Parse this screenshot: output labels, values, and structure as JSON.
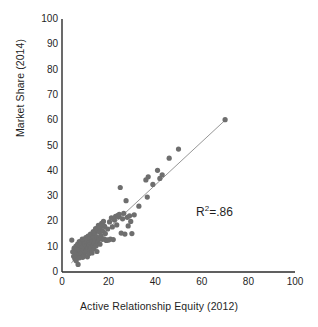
{
  "chart_data": {
    "type": "scatter",
    "title": "",
    "xlabel": "Active Relationship Equity (2012)",
    "ylabel": "Market Share (2014)",
    "xlim": [
      0,
      100
    ],
    "ylim": [
      0,
      100
    ],
    "xticks": [
      0,
      20,
      40,
      60,
      80,
      100
    ],
    "yticks": [
      0,
      10,
      20,
      30,
      40,
      50,
      60,
      70,
      80,
      90,
      100
    ],
    "grid": false,
    "legend": null,
    "annotations": [
      {
        "name": "r-squared",
        "text_prefix": "R",
        "text_sup": "2",
        "text_suffix": "=.86",
        "value": 0.86,
        "x": 56,
        "y": 24
      }
    ],
    "marker": {
      "shape": "circle",
      "size_px": 2.6,
      "color": "#6e6e6e"
    },
    "trendline": {
      "type": "linear",
      "color": "#8a8a8a",
      "width_px": 0.9,
      "x_start": 4.0,
      "y_start": 3.6,
      "x_end": 70.0,
      "y_end": 60.0
    },
    "axis_color": "#2b2b2b",
    "points": [
      [
        4.2,
        12.6
      ],
      [
        4.6,
        8.0
      ],
      [
        5.0,
        6.2
      ],
      [
        5.2,
        9.4
      ],
      [
        5.5,
        5.2
      ],
      [
        5.8,
        7.6
      ],
      [
        6.0,
        10.2
      ],
      [
        6.1,
        4.4
      ],
      [
        6.3,
        8.8
      ],
      [
        6.5,
        6.6
      ],
      [
        6.7,
        11.0
      ],
      [
        6.9,
        3.0
      ],
      [
        7.0,
        9.0
      ],
      [
        7.2,
        7.0
      ],
      [
        7.4,
        12.0
      ],
      [
        7.5,
        5.6
      ],
      [
        7.7,
        10.6
      ],
      [
        7.9,
        8.2
      ],
      [
        8.0,
        6.8
      ],
      [
        8.2,
        11.6
      ],
      [
        8.4,
        9.6
      ],
      [
        8.5,
        7.4
      ],
      [
        8.7,
        13.0
      ],
      [
        8.9,
        5.8
      ],
      [
        9.0,
        10.0
      ],
      [
        9.2,
        8.6
      ],
      [
        9.4,
        12.2
      ],
      [
        9.5,
        6.4
      ],
      [
        9.7,
        9.8
      ],
      [
        9.9,
        11.4
      ],
      [
        10.0,
        7.8
      ],
      [
        10.2,
        13.6
      ],
      [
        10.4,
        10.4
      ],
      [
        10.5,
        8.4
      ],
      [
        10.7,
        12.8
      ],
      [
        10.9,
        6.0
      ],
      [
        11.0,
        9.2
      ],
      [
        11.2,
        14.2
      ],
      [
        11.4,
        11.2
      ],
      [
        11.5,
        7.2
      ],
      [
        11.7,
        10.8
      ],
      [
        11.9,
        13.2
      ],
      [
        12.0,
        8.9
      ],
      [
        12.2,
        15.0
      ],
      [
        12.4,
        11.8
      ],
      [
        12.5,
        9.5
      ],
      [
        12.7,
        14.6
      ],
      [
        12.9,
        7.5
      ],
      [
        13.0,
        12.4
      ],
      [
        13.2,
        10.1
      ],
      [
        13.4,
        16.0
      ],
      [
        13.5,
        13.8
      ],
      [
        13.7,
        9.1
      ],
      [
        13.9,
        11.5
      ],
      [
        14.0,
        15.4
      ],
      [
        14.2,
        12.7
      ],
      [
        14.4,
        17.2
      ],
      [
        14.6,
        10.3
      ],
      [
        14.8,
        14.0
      ],
      [
        15.0,
        8.1
      ],
      [
        15.2,
        16.6
      ],
      [
        15.4,
        12.1
      ],
      [
        15.6,
        18.4
      ],
      [
        15.8,
        13.4
      ],
      [
        16.0,
        15.8
      ],
      [
        16.3,
        11.0
      ],
      [
        16.5,
        17.6
      ],
      [
        16.8,
        14.4
      ],
      [
        17.0,
        19.2
      ],
      [
        17.3,
        12.9
      ],
      [
        17.5,
        16.2
      ],
      [
        17.8,
        20.0
      ],
      [
        18.0,
        13.1
      ],
      [
        18.3,
        18.0
      ],
      [
        18.6,
        15.2
      ],
      [
        19.0,
        12.5
      ],
      [
        19.3,
        12.7
      ],
      [
        19.6,
        17.0
      ],
      [
        20.0,
        12.6
      ],
      [
        20.4,
        19.8
      ],
      [
        20.8,
        13.0
      ],
      [
        21.2,
        21.4
      ],
      [
        21.6,
        17.8
      ],
      [
        22.0,
        12.8
      ],
      [
        22.5,
        20.6
      ],
      [
        23.0,
        22.0
      ],
      [
        23.5,
        18.6
      ],
      [
        24.0,
        22.4
      ],
      [
        24.3,
        21.8
      ],
      [
        24.6,
        22.8
      ],
      [
        25.0,
        33.4
      ],
      [
        25.4,
        15.4
      ],
      [
        26.0,
        21.0
      ],
      [
        26.5,
        23.2
      ],
      [
        27.0,
        15.0
      ],
      [
        27.5,
        28.2
      ],
      [
        28.0,
        21.6
      ],
      [
        28.4,
        18.2
      ],
      [
        29.0,
        22.2
      ],
      [
        29.5,
        20.0
      ],
      [
        30.0,
        15.2
      ],
      [
        31.0,
        22.6
      ],
      [
        33.0,
        26.0
      ],
      [
        36.0,
        36.4
      ],
      [
        36.6,
        29.6
      ],
      [
        37.0,
        37.6
      ],
      [
        39.0,
        34.6
      ],
      [
        41.0,
        40.2
      ],
      [
        42.0,
        37.0
      ],
      [
        43.0,
        38.4
      ],
      [
        46.0,
        45.0
      ],
      [
        50.0,
        48.6
      ],
      [
        70.0,
        60.2
      ]
    ]
  },
  "axis": {
    "y_tick_labels": [
      "100",
      "90",
      "80",
      "70",
      "60",
      "50",
      "40",
      "30",
      "20",
      "10",
      "0"
    ],
    "x_tick_labels": [
      "0",
      "20",
      "40",
      "60",
      "80",
      "100"
    ],
    "y_title": "Market Share (2014)",
    "x_title": "Active Relationship Equity (2012)"
  },
  "annotation": {
    "r2_prefix": "R",
    "r2_sup": "2",
    "r2_suffix": "=.86"
  }
}
